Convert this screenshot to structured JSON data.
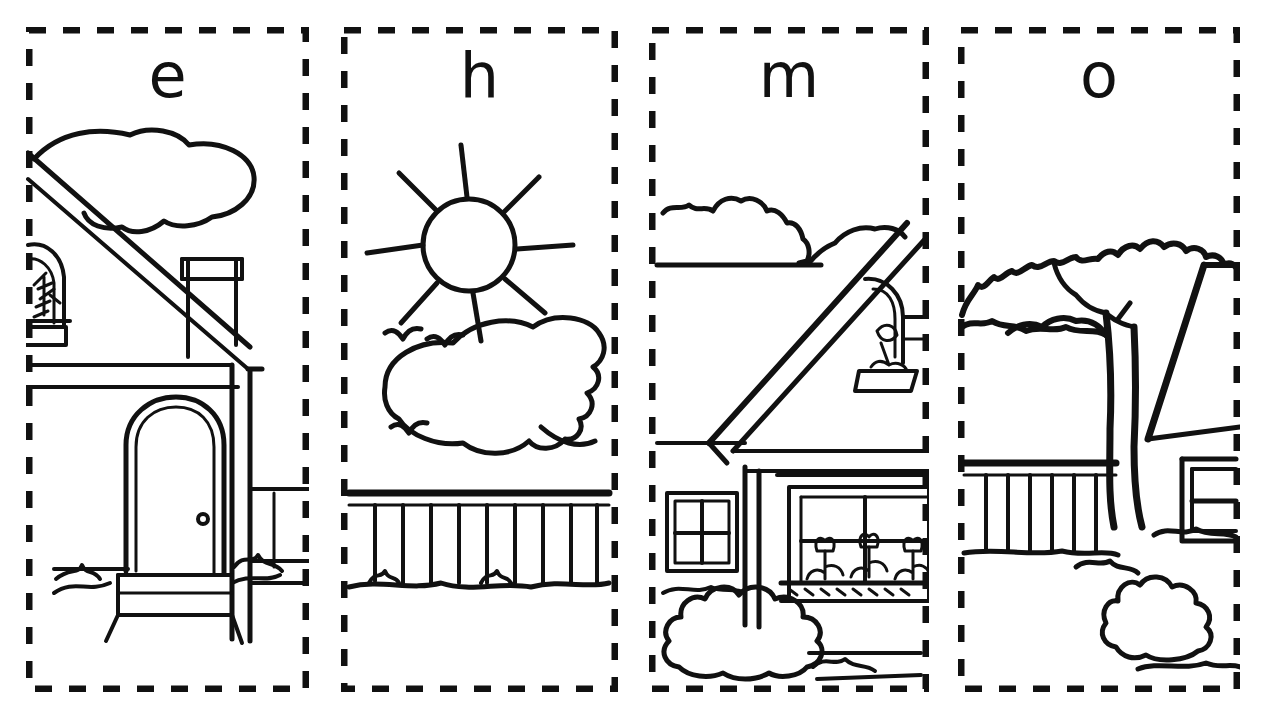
{
  "page": {
    "background_color": "#ffffff",
    "ink_color": "#111111",
    "style": "black-and-white line art coloring worksheet",
    "panel_count": 4,
    "border_style": "dashed cut-line"
  },
  "panels": [
    {
      "id": "panel-e",
      "letter": "e",
      "letter_name": "lowercase-e",
      "scene": "house with sloped roof, cloud, dormer window with plant, chimney, arched front door with doorknob and step, grass tufts",
      "elements": [
        "cloud",
        "roof",
        "dormer-window",
        "window-plant",
        "chimney",
        "house-wall",
        "arched-door",
        "doorknob",
        "door-step",
        "grass",
        "fence-rail"
      ]
    },
    {
      "id": "panel-h",
      "letter": "h",
      "letter_name": "lowercase-h",
      "scene": "sun with eight rays, a large cloud, three flying birds, and a picket fence with grass",
      "elements": [
        "sun",
        "sun-rays",
        "cloud",
        "birds",
        "picket-fence",
        "grass"
      ]
    },
    {
      "id": "panel-m",
      "letter": "m",
      "letter_name": "lowercase-m",
      "scene": "house corner with gabled roof, hedge on roofline, dormer window with plant, small pane window, large window with flower box holding three tulips, and a rounded bush",
      "elements": [
        "hedge",
        "roof",
        "dormer-window",
        "window-plant",
        "house-wall",
        "small-window",
        "large-window",
        "flower-box",
        "tulips",
        "bush",
        "grass"
      ]
    },
    {
      "id": "panel-o",
      "letter": "o",
      "letter_name": "lowercase-o",
      "scene": "large leafy tree with trunk and branches in front of a house roof edge, a picket fence, a window, and a bush",
      "elements": [
        "tree-canopy",
        "tree-trunk",
        "tree-branches",
        "roof-edge",
        "picket-fence",
        "window",
        "bush",
        "grass"
      ]
    }
  ]
}
